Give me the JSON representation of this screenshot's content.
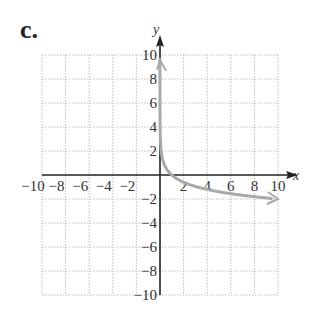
{
  "part_label": "c.",
  "chart_data": {
    "type": "line",
    "title": "",
    "xlabel": "x",
    "ylabel": "y",
    "xlim": [
      -10,
      10
    ],
    "ylim": [
      -10,
      10
    ],
    "grid": true,
    "x_ticks": [
      -10,
      -8,
      -6,
      -4,
      -2,
      2,
      4,
      6,
      8,
      10
    ],
    "y_ticks": [
      -10,
      -8,
      -6,
      -4,
      -2,
      2,
      4,
      6,
      8,
      10
    ],
    "x_tick_labels": [
      "−10",
      "−8",
      "−6",
      "−4",
      "−2",
      "2",
      "4",
      "6",
      "8",
      "10"
    ],
    "y_tick_labels": [
      "−10",
      "−8",
      "−6",
      "−4",
      "−2",
      "2",
      "4",
      "6",
      "8",
      "10"
    ],
    "series": [
      {
        "name": "curve",
        "color": "#a9a9a9",
        "points": [
          [
            0.0001,
            8
          ],
          [
            0.001,
            6
          ],
          [
            0.01,
            4
          ],
          [
            0.1,
            2
          ],
          [
            0.5,
            0.6
          ],
          [
            1,
            0
          ],
          [
            2,
            -0.6
          ],
          [
            4,
            -1.2
          ],
          [
            6,
            -1.56
          ],
          [
            8,
            -1.8
          ],
          [
            10,
            -2
          ]
        ],
        "arrows": "both ends"
      }
    ]
  },
  "colors": {
    "axis": "#222222",
    "grid": "#bdbdbd",
    "curve": "#a9a9a9"
  }
}
